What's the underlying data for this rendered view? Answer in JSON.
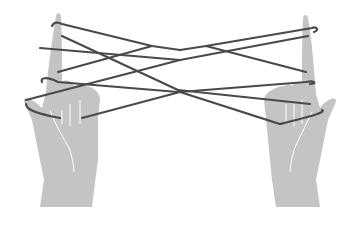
{
  "illustration": {
    "subject": "two hands holding string figure (cat's cradle)",
    "colors": {
      "background": "#ffffff",
      "hand": "#c4c4c4",
      "string": "#4a4a4a",
      "crease": "#ffffff"
    }
  }
}
